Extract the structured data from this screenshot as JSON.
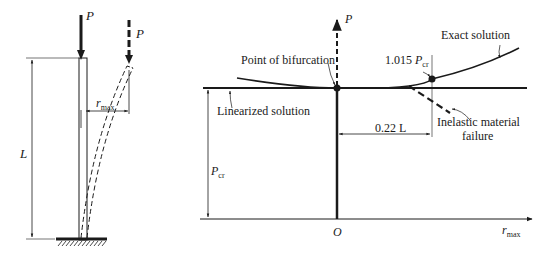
{
  "column_figure": {
    "load_label": "P",
    "deflected_load_label": "P",
    "length_label": "L",
    "deflection_label": "r",
    "deflection_sub": "max"
  },
  "graph": {
    "y_axis_label": "P",
    "x_axis_label": "r",
    "x_axis_sub": "max",
    "origin_label": "O",
    "pcr_label": "P",
    "pcr_sub": "cr",
    "bifurcation_label": "Point of bifurcation",
    "linearized_label": "Linearized solution",
    "exact_label": "Exact solution",
    "critical_value_prefix": "1.015 ",
    "critical_value_symbol": "P",
    "critical_value_sub": "cr",
    "offset_label": "0.22 L",
    "inelastic_label_line1": "Inelastic material",
    "inelastic_label_line2": "failure"
  }
}
